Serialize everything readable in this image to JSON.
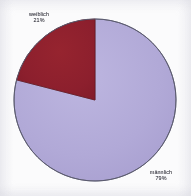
{
  "chart_data": {
    "type": "pie",
    "title": "",
    "categories": [
      "männlich",
      "weiblich"
    ],
    "values": [
      79,
      21
    ],
    "unit": "%",
    "legend": "none",
    "grid": false,
    "slices": [
      {
        "label": "männlich",
        "value": 79,
        "value_text": "79%",
        "color": "#b1a9d7",
        "start_angle_deg": 75.6,
        "end_angle_deg": 360.0,
        "label_position": "bottom-right-outside"
      },
      {
        "label": "weiblich",
        "value": 21,
        "value_text": "21%",
        "color": "#8c1f2d",
        "start_angle_deg": 0.0,
        "end_angle_deg": 75.6,
        "label_position": "top-left-outside"
      }
    ]
  },
  "labels": {
    "weiblich": {
      "name": "weiblich",
      "percent": "21%"
    },
    "maennlich": {
      "name": "männlich",
      "percent": "79%"
    }
  },
  "colors": {
    "background": "#fbfbfc",
    "slice_female": "#8c1f2d",
    "slice_male": "#b1a9d7",
    "outline": "#5a5a6e",
    "label_text": "#3b3b44"
  },
  "geometry": {
    "center_x": 82,
    "center_y": 83,
    "radius": 81
  }
}
